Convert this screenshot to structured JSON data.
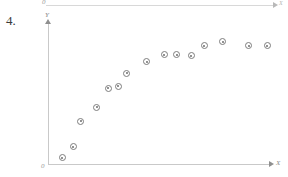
{
  "item_number": "4.",
  "axes": {
    "x_label": "X",
    "y_label": "Y",
    "origin_label": "0"
  },
  "previous_figure_remnant": {
    "x_label": "X",
    "origin_label": "0"
  },
  "colors": {
    "axis": "#c9c9c9",
    "arrow": "#8f8f8f",
    "marker_stroke": "#7d7d7d",
    "marker_fill": "#ffffff",
    "marker_dot": "#6e6e6e",
    "label_text": "#8a8a8a",
    "number_text": "#3a3a3a"
  },
  "chart_data": {
    "type": "scatter",
    "title": "",
    "subtitle": "",
    "xlabel": "X",
    "ylabel": "Y",
    "grid": false,
    "legend": null,
    "annotations": [],
    "xlim": [
      0,
      15.5
    ],
    "ylim": [
      0,
      10
    ],
    "x_tick_labels": [],
    "y_tick_labels": [],
    "series": [
      {
        "name": "observations",
        "marker": "circled-dot",
        "points": [
          {
            "x": 1.0,
            "y": 0.45
          },
          {
            "x": 1.75,
            "y": 1.25
          },
          {
            "x": 2.3,
            "y": 3.05
          },
          {
            "x": 3.4,
            "y": 4.05
          },
          {
            "x": 4.2,
            "y": 5.4
          },
          {
            "x": 4.9,
            "y": 5.55
          },
          {
            "x": 5.5,
            "y": 6.5
          },
          {
            "x": 6.9,
            "y": 7.3
          },
          {
            "x": 8.1,
            "y": 7.8
          },
          {
            "x": 9.0,
            "y": 7.8
          },
          {
            "x": 10.0,
            "y": 7.75
          },
          {
            "x": 10.9,
            "y": 8.45
          },
          {
            "x": 12.2,
            "y": 8.75
          },
          {
            "x": 14.0,
            "y": 8.45
          },
          {
            "x": 15.3,
            "y": 8.45
          }
        ]
      }
    ]
  },
  "marker_pixels": [
    {
      "x": 66,
      "y": 158
    },
    {
      "x": 76,
      "y": 147
    },
    {
      "x": 84,
      "y": 122
    },
    {
      "x": 100,
      "y": 108
    },
    {
      "x": 111,
      "y": 89
    },
    {
      "x": 121,
      "y": 87
    },
    {
      "x": 130,
      "y": 74
    },
    {
      "x": 150,
      "y": 63
    },
    {
      "x": 167,
      "y": 56
    },
    {
      "x": 180,
      "y": 56
    },
    {
      "x": 194,
      "y": 57
    },
    {
      "x": 207,
      "y": 47
    },
    {
      "x": 225,
      "y": 43
    },
    {
      "x": 250,
      "y": 47
    },
    {
      "x": 269,
      "y": 47
    }
  ]
}
